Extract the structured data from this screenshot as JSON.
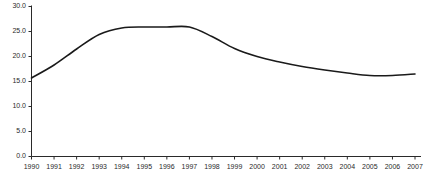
{
  "chart_data": {
    "type": "line",
    "title": "",
    "subtitle": "",
    "xlabel": "",
    "ylabel": "",
    "categories": [
      "1990",
      "1991",
      "1992",
      "1993",
      "1994",
      "1995",
      "1996",
      "1997",
      "1998",
      "1999",
      "2000",
      "2001",
      "2002",
      "2003",
      "2004",
      "2005",
      "2006",
      "2007"
    ],
    "x": [
      1990,
      1991,
      1992,
      1993,
      1994,
      1995,
      1996,
      1997,
      1998,
      1999,
      2000,
      2001,
      2002,
      2003,
      2004,
      2005,
      2006,
      2007
    ],
    "values": [
      15.7,
      18.3,
      21.5,
      24.4,
      25.7,
      25.9,
      25.9,
      25.9,
      24.0,
      21.6,
      20.0,
      18.9,
      18.0,
      17.3,
      16.7,
      16.2,
      16.2,
      16.5
    ],
    "series": [
      {
        "name": "series-1",
        "values": [
          15.7,
          18.3,
          21.5,
          24.4,
          25.7,
          25.9,
          25.9,
          25.9,
          24.0,
          21.6,
          20.0,
          18.9,
          18.0,
          17.3,
          16.7,
          16.2,
          16.2,
          16.5
        ],
        "color": "#1a1a1a"
      }
    ],
    "ylim": [
      0.0,
      30.0
    ],
    "yticks": [
      0.0,
      5.0,
      10.0,
      15.0,
      20.0,
      25.0,
      30.0
    ],
    "ytick_labels": [
      "0.0",
      "5.0",
      "10.0",
      "15.0",
      "20.0",
      "25.0",
      "30.0"
    ],
    "xticks": [
      1990,
      1991,
      1992,
      1993,
      1994,
      1995,
      1996,
      1997,
      1998,
      1999,
      2000,
      2001,
      2002,
      2003,
      2004,
      2005,
      2006,
      2007
    ],
    "grid": false,
    "legend": "none",
    "axis_color": "#2a2a2a",
    "line_color": "#1a1a1a",
    "background": "#ffffff"
  },
  "axes": {
    "y_labels": [
      "30.0",
      "25.0",
      "20.0",
      "15.0",
      "10.0",
      "5.0",
      "0.0"
    ],
    "x_labels": [
      "1990",
      "1991",
      "1992",
      "1993",
      "1994",
      "1995",
      "1996",
      "1997",
      "1998",
      "1999",
      "2000",
      "2001",
      "2002",
      "2003",
      "2004",
      "2005",
      "2006",
      "2007"
    ]
  }
}
